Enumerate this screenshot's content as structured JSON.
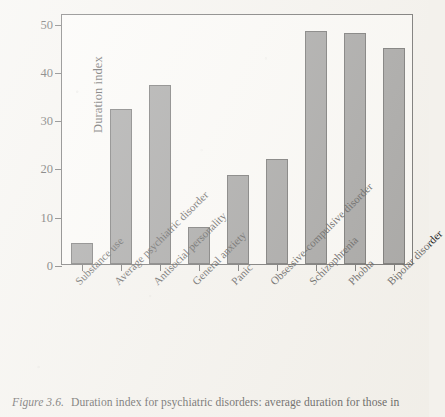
{
  "chart_data": {
    "type": "bar",
    "title": "",
    "xlabel": "",
    "ylabel": "Duration index",
    "ylim": [
      0,
      52
    ],
    "yticks": [
      0,
      10,
      20,
      30,
      40,
      50
    ],
    "grid": false,
    "legend": null,
    "bar_color": "#818181",
    "bar_edge_color": "#3d3d3d",
    "axis_color": "#3a3a3a",
    "plot_background": "#fbfaf7",
    "page_background": "#f3f1ec",
    "categories": [
      "Substance use",
      "Average psychiatric disorder",
      "Antisocial personality",
      "General anxiety",
      "Panic",
      "Obsessive-compulsive disorder",
      "Schizophrenia",
      "Phobia",
      "Bipolar disorder"
    ],
    "values": [
      4.4,
      32.2,
      37.0,
      7.7,
      18.5,
      21.8,
      48.2,
      47.8,
      44.8
    ]
  },
  "caption": {
    "figure_number": "Figure 3.6.",
    "text": "Duration index for psychiatric disorders: average duration for those in"
  }
}
